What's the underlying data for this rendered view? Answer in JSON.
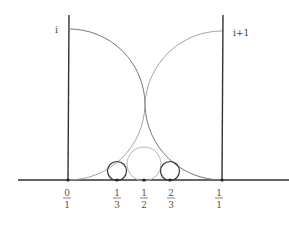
{
  "diagram": {
    "type": "hyperbolic-geodesics-farey",
    "labels": {
      "left_top": "i",
      "right_top": "i+1"
    },
    "axis_ticks": [
      {
        "num": "0",
        "den": "1",
        "x": 68
      },
      {
        "num": "1",
        "den": "3",
        "x": 117
      },
      {
        "num": "1",
        "den": "2",
        "x": 144
      },
      {
        "num": "2",
        "den": "3",
        "x": 170
      },
      {
        "num": "1",
        "den": "1",
        "x": 219
      }
    ],
    "colors": {
      "stroke": "#333333",
      "arc": "#777777",
      "background": "#ffffff"
    }
  }
}
